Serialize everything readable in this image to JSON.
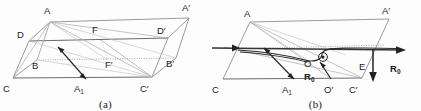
{
  "figure": {
    "panels": [
      {
        "id": "a",
        "caption": "(a)",
        "vertex_labels": [
          {
            "name": "A",
            "text": "A",
            "sub": "",
            "x": 44,
            "y": 14
          },
          {
            "name": "A-prime",
            "text": "A",
            "sub": "",
            "prime": true,
            "x": 182,
            "y": 11
          },
          {
            "name": "D",
            "text": "D",
            "sub": "",
            "x": 21,
            "y": 34
          },
          {
            "name": "D-prime",
            "text": "D",
            "sub": "",
            "prime": true,
            "x": 159,
            "y": 30
          },
          {
            "name": "F",
            "text": "F",
            "sub": "",
            "x": 92,
            "y": 31
          },
          {
            "name": "F-prime",
            "text": "F",
            "sub": "",
            "prime": true,
            "x": 108,
            "y": 64
          },
          {
            "name": "B",
            "text": "B",
            "sub": "",
            "x": 34,
            "y": 66
          },
          {
            "name": "B-prime",
            "text": "B",
            "sub": "",
            "prime": true,
            "x": 167,
            "y": 64
          },
          {
            "name": "C",
            "text": "C",
            "sub": "",
            "x": 5,
            "y": 85
          },
          {
            "name": "C-prime",
            "text": "C",
            "sub": "",
            "prime": true,
            "x": 143,
            "y": 85
          },
          {
            "name": "A1",
            "text": "A",
            "sub": "1",
            "x": 78,
            "y": 85
          }
        ]
      },
      {
        "id": "b",
        "caption": "(b)",
        "vertex_labels": [
          {
            "name": "A",
            "text": "A",
            "sub": "",
            "x": 34,
            "y": 16
          },
          {
            "name": "A-prime",
            "text": "A",
            "sub": "",
            "prime": true,
            "x": 172,
            "y": 13
          },
          {
            "name": "C",
            "text": "C",
            "sub": "",
            "x": 3,
            "y": 87
          },
          {
            "name": "C-prime",
            "text": "C",
            "sub": "",
            "prime": true,
            "x": 141,
            "y": 87
          },
          {
            "name": "A1",
            "text": "A",
            "sub": "1",
            "x": 76,
            "y": 87
          },
          {
            "name": "O",
            "text": "O",
            "sub": "",
            "x": 96,
            "y": 63
          },
          {
            "name": "O-prime",
            "text": "O",
            "sub": "",
            "prime": true,
            "x": 117,
            "y": 87
          },
          {
            "name": "E",
            "text": "E",
            "sub": "",
            "x": 151,
            "y": 66
          }
        ],
        "vector_labels": [
          {
            "name": "R0-inner",
            "text": "R",
            "sub": "0",
            "bold": true,
            "x": 98,
            "y": 76
          },
          {
            "name": "R0-outer",
            "text": "R",
            "sub": "0",
            "bold": true,
            "x": 184,
            "y": 68
          }
        ]
      }
    ]
  },
  "colors": {
    "background": "#fdfdfd",
    "edge": "#8e8e8e",
    "edge_dark": "#6a6a6a",
    "dotted": "#9a9a9a",
    "vector": "#222222",
    "text": "#1c1c1c"
  }
}
